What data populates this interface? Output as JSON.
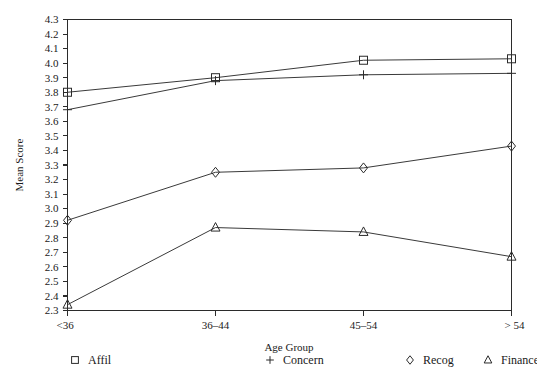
{
  "chart_data": {
    "type": "line",
    "title": "",
    "xlabel": "Age Group",
    "ylabel": "Mean Score",
    "categories": [
      "<36",
      "36–44",
      "45–54",
      "> 54"
    ],
    "ylim": [
      2.3,
      4.3
    ],
    "ytick_step": 0.1,
    "ytick_labels": [
      "4.3",
      "4.2",
      "4.1",
      "4.0",
      "3.9",
      "3.8",
      "3.7",
      "3.6",
      "3.5",
      "3.4",
      "3.3",
      "3.2",
      "3.1",
      "3.0",
      "2.9",
      "2.8",
      "2.7",
      "2.6",
      "2.5",
      "2.4",
      "2.3"
    ],
    "grid": false,
    "legend_position": "bottom",
    "series": [
      {
        "name": "Affil",
        "marker": "square",
        "values": [
          3.8,
          3.9,
          4.02,
          4.03
        ]
      },
      {
        "name": "Concern",
        "marker": "plus",
        "values": [
          3.68,
          3.88,
          3.92,
          3.93
        ]
      },
      {
        "name": "Recog",
        "marker": "diamond",
        "values": [
          2.92,
          3.25,
          3.28,
          3.43
        ]
      },
      {
        "name": "Finance",
        "marker": "triangle",
        "values": [
          2.34,
          2.87,
          2.84,
          2.67
        ]
      }
    ]
  },
  "legend": {
    "entries": [
      {
        "label": "Affil",
        "marker": "square"
      },
      {
        "label": "Concern",
        "marker": "plus"
      },
      {
        "label": "Recog",
        "marker": "diamond"
      },
      {
        "label": "Finance",
        "marker": "triangle"
      }
    ]
  },
  "colors": {
    "axis": "#2b2b2b",
    "line": "#3a3a3a",
    "text": "#1a1a1a",
    "background": "#ffffff"
  }
}
